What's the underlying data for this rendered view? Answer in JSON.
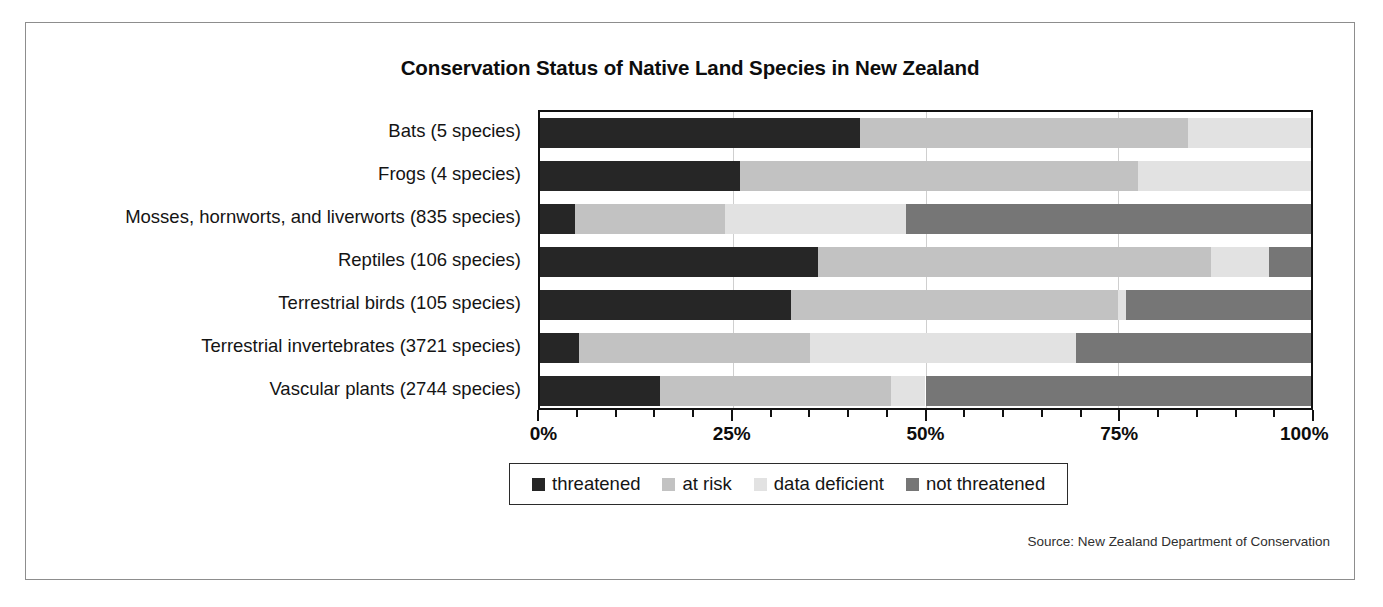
{
  "figure": {
    "title": "Conservation Status of Native Land Species in New Zealand",
    "source_note": "Source: New Zealand Department of Conservation"
  },
  "legend": {
    "items": [
      {
        "label": "threatened",
        "color": "#262626"
      },
      {
        "label": "at risk",
        "color": "#c2c2c2"
      },
      {
        "label": "data deficient",
        "color": "#e2e2e2"
      },
      {
        "label": "not threatened",
        "color": "#767676"
      }
    ]
  },
  "axis": {
    "x_ticks": [
      "0%",
      "25%",
      "50%",
      "75%",
      "100%"
    ],
    "x_tick_values": [
      0,
      25,
      50,
      75,
      100
    ],
    "x_minor_step": 5,
    "x_min": 0,
    "x_max": 100
  },
  "chart_data": {
    "type": "bar",
    "orientation": "horizontal",
    "stacked": true,
    "stack_mode": "percent",
    "title": "Conservation Status of Native Land Species in New Zealand",
    "xlabel": "",
    "ylabel": "",
    "xlim": [
      0,
      100
    ],
    "grid": true,
    "grid_axis": "x",
    "legend_position": "bottom",
    "categories": [
      "Bats (5 species)",
      "Frogs (4 species)",
      "Mosses, hornworts, and liverworts (835 species)",
      "Reptiles (106 species)",
      "Terrestrial birds (105 species)",
      "Terrestrial invertebrates (3721 species)",
      "Vascular plants (2744 species)"
    ],
    "series": [
      {
        "name": "threatened",
        "color": "#262626",
        "values": [
          41.5,
          26.0,
          4.5,
          36.0,
          32.5,
          5.0,
          15.5
        ]
      },
      {
        "name": "at risk",
        "color": "#c2c2c2",
        "values": [
          42.5,
          51.5,
          19.5,
          51.0,
          42.5,
          30.0,
          30.0
        ]
      },
      {
        "name": "data deficient",
        "color": "#e2e2e2",
        "values": [
          16.0,
          22.5,
          23.5,
          7.5,
          1.0,
          34.5,
          4.5
        ]
      },
      {
        "name": "not threatened",
        "color": "#767676",
        "values": [
          0.0,
          0.0,
          52.5,
          5.5,
          24.0,
          30.5,
          50.0
        ]
      }
    ]
  }
}
